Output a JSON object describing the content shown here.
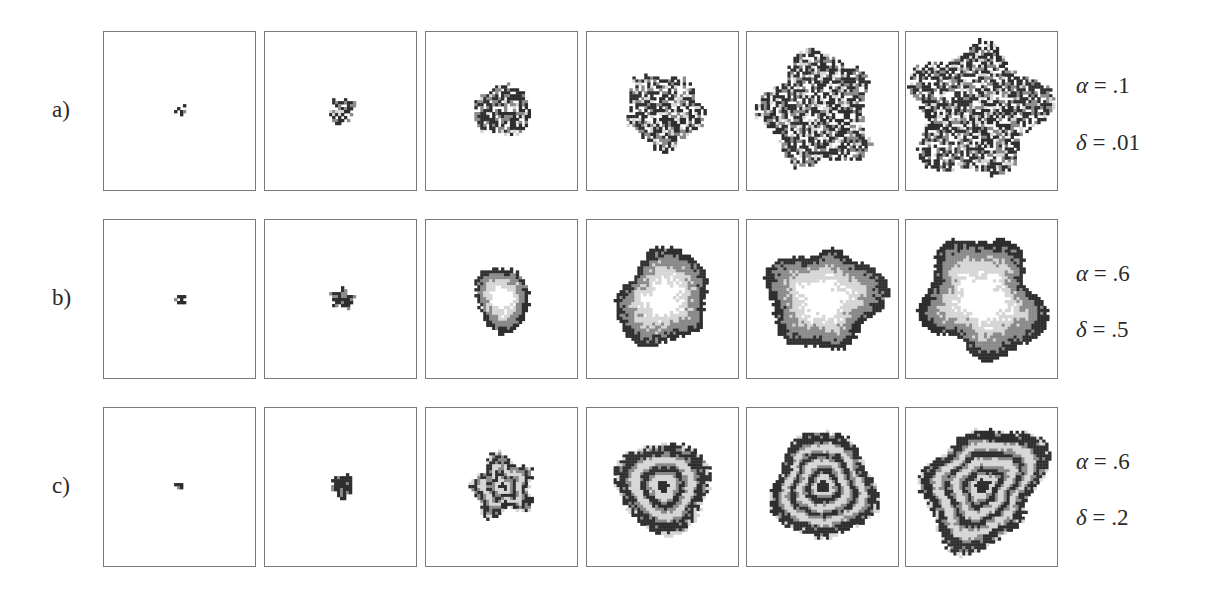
{
  "figure": {
    "rows": [
      {
        "label": "a)",
        "params": [
          {
            "symbol": "α",
            "eq": " = ",
            "value": ".1"
          },
          {
            "symbol": "δ",
            "eq": " = ",
            "value": ".01"
          }
        ],
        "pattern": "sparse-cluster",
        "panels": [
          {
            "step": 1,
            "radius": 5
          },
          {
            "step": 2,
            "radius": 14
          },
          {
            "step": 3,
            "radius": 30
          },
          {
            "step": 4,
            "radius": 42
          },
          {
            "step": 5,
            "radius": 62
          },
          {
            "step": 6,
            "radius": 72
          }
        ]
      },
      {
        "label": "b)",
        "params": [
          {
            "symbol": "α",
            "eq": " = ",
            "value": ".6"
          },
          {
            "symbol": "δ",
            "eq": " = ",
            "value": ".5"
          }
        ],
        "pattern": "single-ring",
        "panels": [
          {
            "step": 1,
            "radius": 5
          },
          {
            "step": 2,
            "radius": 11
          },
          {
            "step": 3,
            "radius": 33
          },
          {
            "step": 4,
            "radius": 52
          },
          {
            "step": 5,
            "radius": 60
          },
          {
            "step": 6,
            "radius": 66
          }
        ]
      },
      {
        "label": "c)",
        "params": [
          {
            "symbol": "α",
            "eq": " = ",
            "value": ".6"
          },
          {
            "symbol": "δ",
            "eq": " = ",
            "value": ".2"
          }
        ],
        "pattern": "concentric-rings",
        "panels": [
          {
            "step": 1,
            "radius": 5
          },
          {
            "step": 2,
            "radius": 12
          },
          {
            "step": 3,
            "radius": 33
          },
          {
            "step": 4,
            "radius": 52
          },
          {
            "step": 5,
            "radius": 59
          },
          {
            "step": 6,
            "radius": 67
          }
        ]
      }
    ]
  },
  "colors": {
    "frame": "#7a7a7a",
    "dark": "#2e2e2e",
    "mid": "#8a8a8a",
    "light": "#d6d6d6",
    "background": "#ffffff"
  }
}
